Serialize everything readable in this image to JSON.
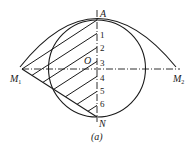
{
  "figure": {
    "caption": "(a)",
    "points": {
      "A": "A",
      "N": "N",
      "O": "O",
      "M1": "M",
      "M1_sub": "1",
      "M2": "M",
      "M2_sub": "2"
    },
    "division_labels": [
      "1",
      "2",
      "3",
      "4",
      "5",
      "6"
    ],
    "colors": {
      "stroke": "#1a1a1a",
      "background": "#ffffff"
    }
  }
}
